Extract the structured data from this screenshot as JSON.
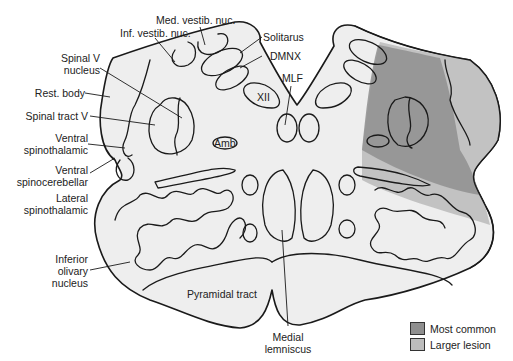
{
  "figure": {
    "labels": {
      "med_vestib": "Med. vestib. nuc.",
      "inf_vestib": "Inf. vestib. nuc.",
      "spinal_v_nucleus_1": "Spinal V",
      "spinal_v_nucleus_2": "nucleus",
      "rest_body": "Rest. body",
      "spinal_tract_v": "Spinal tract V",
      "ventral_spinothal_1": "Ventral",
      "ventral_spinothal_2": "spinothalamic",
      "ventral_spinocereb_1": "Ventral",
      "ventral_spinocereb_2": "spinocerebellar",
      "lateral_spinothal_1": "Lateral",
      "lateral_spinothal_2": "spinothalamic",
      "inferior_olivary_1": "Inferior",
      "inferior_olivary_2": "olivary",
      "inferior_olivary_3": "nucleus",
      "solitarus": "Solitarus",
      "dmnx": "DMNX",
      "mlf": "MLF",
      "xii": "XII",
      "amb": "Amb",
      "pyramidal_tract": "Pyramidal tract",
      "medial_lemniscus_1": "Medial",
      "medial_lemniscus_2": "lemniscus"
    },
    "legend": [
      {
        "label": "Most common",
        "color": "#8f8f8f"
      },
      {
        "label": "Larger lesion",
        "color": "#bdbdbd"
      }
    ],
    "colors": {
      "tissue": "#eeeeee",
      "most_common": "#8f8f8f",
      "larger_lesion": "#bdbdbd"
    }
  }
}
